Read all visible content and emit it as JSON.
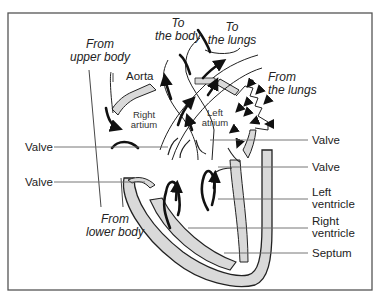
{
  "diagram": {
    "type": "heart-anatomy",
    "colors": {
      "frame": "#555555",
      "wall_fill": "#d9d9d9",
      "wall_stroke": "#222222",
      "arrow": "#111111",
      "leader_line": "#666666"
    },
    "top_labels": {
      "to_body": [
        "To",
        "the body"
      ],
      "to_lungs": [
        "To",
        "the lungs"
      ],
      "from_upper_body": [
        "From",
        "upper body"
      ],
      "from_lungs": [
        "From",
        "the lungs"
      ],
      "from_lower_body": [
        "From",
        "lower body"
      ]
    },
    "chamber_labels": {
      "aorta": "Aorta",
      "right_atrium": [
        "Right",
        "artium"
      ],
      "left_atrium": [
        "Left",
        "atrium"
      ]
    },
    "left_callouts": [
      {
        "label": "Valve"
      },
      {
        "label": "Valve"
      }
    ],
    "right_callouts": [
      {
        "label": [
          "Valve"
        ]
      },
      {
        "label": [
          "Valve"
        ]
      },
      {
        "label": [
          "Left",
          "ventricle"
        ]
      },
      {
        "label": [
          "Right",
          "ventricle"
        ]
      },
      {
        "label": [
          "Septum"
        ]
      }
    ]
  }
}
